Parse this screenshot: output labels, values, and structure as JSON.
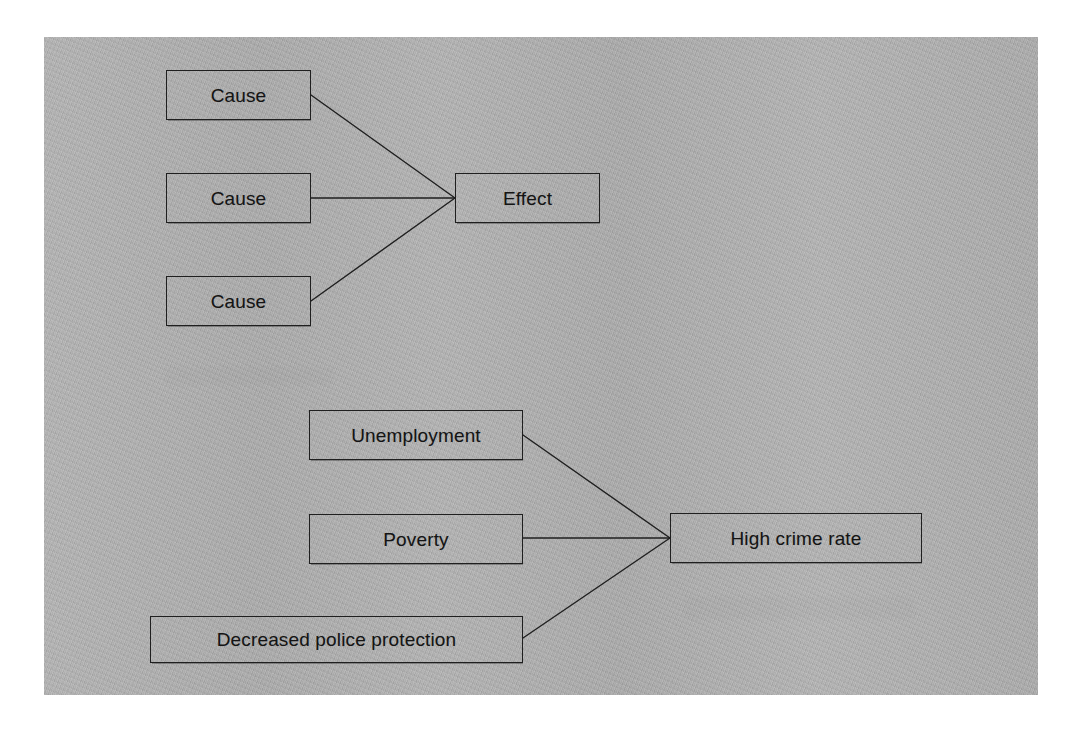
{
  "page": {
    "background_color": "#ffffff",
    "panel_color": "#b2b2b2",
    "stroke_color": "#1f1f1f",
    "text_color": "#141414"
  },
  "diagrams": [
    {
      "id": "generic-cause-effect",
      "name": "Generic cause and effect diagram",
      "causes": [
        {
          "label": "Cause"
        },
        {
          "label": "Cause"
        },
        {
          "label": "Cause"
        }
      ],
      "effect": {
        "label": "Effect"
      }
    },
    {
      "id": "crime-rate-example",
      "name": "Crime rate cause and effect example",
      "causes": [
        {
          "label": "Unemployment"
        },
        {
          "label": "Poverty"
        },
        {
          "label": "Decreased police protection"
        }
      ],
      "effect": {
        "label": "High crime rate"
      }
    }
  ]
}
